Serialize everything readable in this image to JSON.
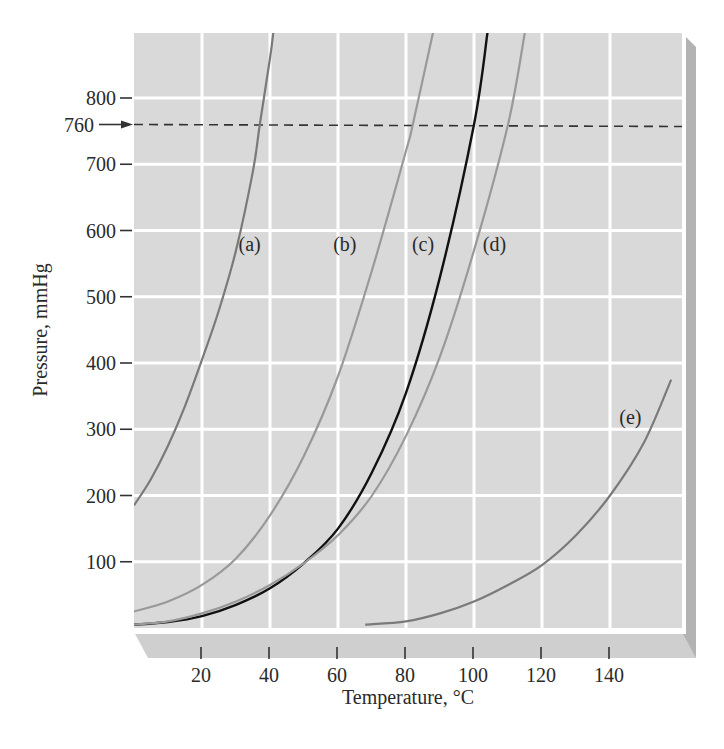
{
  "chart_data": {
    "type": "line",
    "title": "",
    "xlabel": "Temperature, °C",
    "ylabel": "Pressure, mmHg",
    "xlim": [
      0,
      160
    ],
    "ylim": [
      0,
      900
    ],
    "grid": true,
    "legend": "none (curves labeled inline)",
    "x_ticks": [
      20,
      40,
      60,
      80,
      100,
      120,
      140
    ],
    "x_tick_labels": [
      "20",
      "40",
      "60",
      "80",
      "100",
      "120",
      "140"
    ],
    "y_ticks": [
      100,
      200,
      300,
      400,
      500,
      600,
      700,
      800
    ],
    "y_tick_labels": [
      "100",
      "200",
      "300",
      "400",
      "500",
      "600",
      "700",
      "800"
    ],
    "annotations": [
      {
        "type": "reference_line",
        "y": 760,
        "label": "760",
        "style": "dashed",
        "marker": "arrow"
      }
    ],
    "series": [
      {
        "name": "(a)",
        "label_pos": {
          "x": 34,
          "y": 580
        },
        "x": [
          0,
          5,
          10,
          15,
          20,
          25,
          30,
          35,
          37,
          40,
          41
        ],
        "y": [
          185,
          225,
          275,
          335,
          405,
          480,
          570,
          690,
          760,
          860,
          900
        ]
      },
      {
        "name": "(b)",
        "label_pos": {
          "x": 62,
          "y": 580
        },
        "x": [
          0,
          10,
          20,
          30,
          40,
          50,
          60,
          70,
          80,
          82,
          88
        ],
        "y": [
          25,
          40,
          65,
          105,
          170,
          260,
          380,
          540,
          720,
          760,
          900
        ]
      },
      {
        "name": "(c)",
        "label_pos": {
          "x": 85,
          "y": 580
        },
        "x": [
          0,
          10,
          20,
          30,
          40,
          50,
          60,
          70,
          80,
          90,
          100,
          104
        ],
        "y": [
          5,
          9,
          18,
          35,
          60,
          98,
          150,
          235,
          355,
          530,
          760,
          900
        ]
      },
      {
        "name": "(d)",
        "label_pos": {
          "x": 106,
          "y": 580
        },
        "x": [
          0,
          10,
          20,
          30,
          40,
          50,
          60,
          70,
          80,
          90,
          100,
          110,
          115
        ],
        "y": [
          5,
          10,
          22,
          40,
          65,
          98,
          140,
          200,
          290,
          410,
          570,
          760,
          900
        ]
      },
      {
        "name": "(e)",
        "label_pos": {
          "x": 146,
          "y": 318
        },
        "x": [
          68,
          80,
          90,
          100,
          110,
          120,
          130,
          140,
          150,
          158
        ],
        "y": [
          5,
          10,
          22,
          40,
          65,
          95,
          140,
          200,
          280,
          375
        ]
      }
    ]
  },
  "colors": {
    "plot_background": "#d9d9d9",
    "gridline": "#ffffff",
    "bevel_right": "#b3b3b3",
    "bevel_bottom": "#cfcfcf",
    "curve_gray": "#7a7a7a",
    "curve_light_gray": "#999999",
    "curve_black": "#111111",
    "reference_line": "#333333"
  }
}
